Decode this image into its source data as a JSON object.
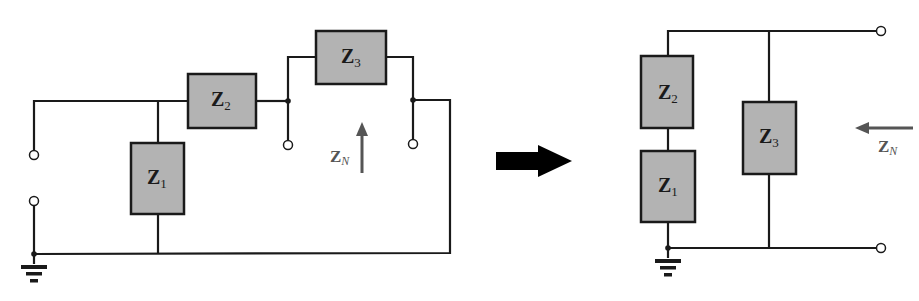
{
  "diagram": {
    "type": "circuit-equivalent-transformation",
    "colors": {
      "wire": "#1a1a1a",
      "box_fill": "#b3b3b3",
      "box_stroke": "#1a1a1a",
      "zn_arrow": "#555555",
      "transform_arrow": "#000000"
    },
    "left_circuit": {
      "components": [
        {
          "id": "Z1",
          "main": "Z",
          "sub": "1"
        },
        {
          "id": "Z2",
          "main": "Z",
          "sub": "2"
        },
        {
          "id": "Z3",
          "main": "Z",
          "sub": "3"
        }
      ],
      "impedance_label": {
        "main": "Z",
        "sub": "N"
      },
      "arrow_direction": "up"
    },
    "right_circuit": {
      "components": [
        {
          "id": "Z2",
          "main": "Z",
          "sub": "2"
        },
        {
          "id": "Z1",
          "main": "Z",
          "sub": "1"
        },
        {
          "id": "Z3",
          "main": "Z",
          "sub": "3"
        }
      ],
      "impedance_label": {
        "main": "Z",
        "sub": "N"
      },
      "arrow_direction": "left"
    },
    "transform_arrow": "right"
  }
}
